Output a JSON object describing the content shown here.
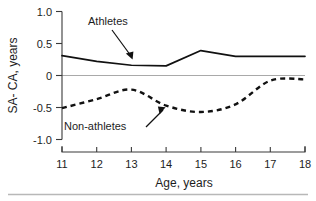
{
  "chart_data": {
    "type": "line",
    "title": "",
    "xlabel": "Age, years",
    "ylabel": "SA- CA, years",
    "xlim": [
      11,
      18
    ],
    "ylim": [
      -1.0,
      1.0
    ],
    "grid": false,
    "legend_position": "inline-annotations",
    "x": [
      11,
      12,
      13,
      14,
      15,
      16,
      17,
      18
    ],
    "xticklabels": [
      "11",
      "12",
      "13",
      "14",
      "15",
      "16",
      "17",
      "18"
    ],
    "yticks": [
      1.0,
      0.5,
      0,
      -0.5,
      -1.0
    ],
    "yticklabels": [
      "1.0",
      "0.5",
      "0",
      "-0.5",
      "-1.0"
    ],
    "series": [
      {
        "name": "Athletes",
        "style": "solid",
        "values": [
          0.31,
          0.22,
          0.16,
          0.15,
          0.39,
          0.3,
          0.3,
          0.3
        ]
      },
      {
        "name": "Non-athletes",
        "style": "dashed",
        "values": [
          -0.51,
          -0.37,
          -0.22,
          -0.47,
          -0.57,
          -0.45,
          -0.08,
          -0.06
        ]
      }
    ],
    "annotations": [
      {
        "text": "Athletes",
        "target_series": "Athletes",
        "points_to_x": 13.0
      },
      {
        "text": "Non-athletes",
        "target_series": "Non-athletes",
        "points_to_x": 14.0
      }
    ],
    "colors": {
      "series_line": "#111111",
      "zero_line": "#a9a9a9",
      "axis": "#3a3a3a",
      "text": "#1d1d1d",
      "background": "#ffffff",
      "footer_rule": "#b8b8b8"
    }
  }
}
